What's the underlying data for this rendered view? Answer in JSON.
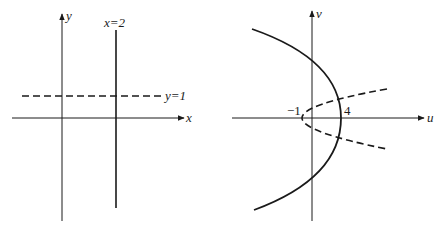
{
  "figure": {
    "left_panel": {
      "axes": {
        "x_label": "x",
        "y_label": "y"
      },
      "lines": [
        {
          "equation": "x=2",
          "label": "x=2",
          "style": "solid",
          "orientation": "vertical",
          "value": 2
        },
        {
          "equation": "y=1",
          "label": "y=1",
          "style": "dashed",
          "orientation": "horizontal",
          "value": 1
        }
      ]
    },
    "right_panel": {
      "axes": {
        "x_label": "u",
        "y_label": "v"
      },
      "curves": [
        {
          "name": "image-of-x=2",
          "style": "solid",
          "shape": "parabola opening left",
          "vertex_u": 4,
          "vertex_label": "4"
        },
        {
          "name": "image-of-y=1",
          "style": "dashed",
          "shape": "parabola opening right",
          "vertex_u": -1,
          "vertex_label": "−1"
        }
      ]
    },
    "colors": {
      "stroke": "#1a1a1a",
      "background": "#ffffff"
    }
  }
}
